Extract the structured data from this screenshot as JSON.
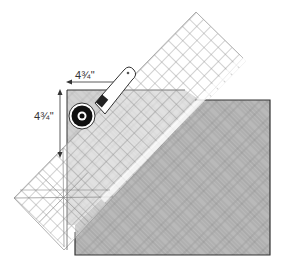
{
  "figure": {
    "measurements": {
      "horizontal_label": "4¾\"",
      "vertical_label": "4¾\""
    },
    "colors": {
      "fabric": "#b8b8b8",
      "fabric_dark_line": "#8a8a8a",
      "fabric_under_ruler": "#cfcfcf",
      "ruler_grid": "#8f8f8f",
      "outline": "#333333",
      "cutter_body": "#ffffff",
      "cutter_blade": "#111111"
    },
    "icons": {
      "cutter": "rotary-cutter-icon",
      "ruler": "quilting-ruler-icon",
      "arrow_horizontal": "double-arrow-horizontal-icon",
      "arrow_vertical": "double-arrow-vertical-icon"
    }
  }
}
